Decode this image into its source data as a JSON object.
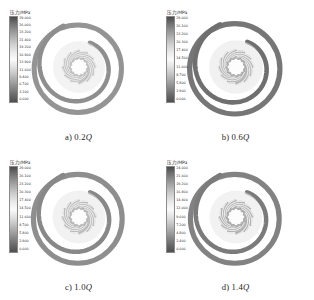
{
  "figure": {
    "type": "contour-grid",
    "columns": 2,
    "rows": 2,
    "background": "#ffffff"
  },
  "colorbar": {
    "title": "压力/MPa",
    "unit": "MPa",
    "quantity": "压力",
    "orientation": "vertical",
    "colormap": "grayscale-rainbow",
    "high_color": "#4a4a4a",
    "mid_color": "#fafafa",
    "low_color": "#4f4f4f"
  },
  "panels": [
    {
      "id": "panel-a",
      "caption_prefix": "a) 0.2",
      "caption_symbol": "Q",
      "flow_rate": "0.2Q",
      "colorbar": {
        "title": "压力/MPa",
        "ticks": [
          "29.000",
          "26.000",
          "23.200",
          "21.400",
          "19.200",
          "16.900",
          "13.900",
          "11.600",
          "9.400",
          "6.700",
          "3.200",
          "0.000"
        ]
      }
    },
    {
      "id": "panel-b",
      "caption_prefix": "b) 0.6",
      "caption_symbol": "Q",
      "flow_rate": "0.6Q",
      "colorbar": {
        "title": "压力/MPa",
        "ticks": [
          "29.000",
          "26.100",
          "23.200",
          "20.300",
          "17.400",
          "14.500",
          "11.600",
          "8.700",
          "5.800",
          "2.900",
          "0.000"
        ]
      }
    },
    {
      "id": "panel-c",
      "caption_prefix": "c) 1.0",
      "caption_symbol": "Q",
      "flow_rate": "1.0Q",
      "colorbar": {
        "title": "压力/MPa",
        "ticks": [
          "29.000",
          "26.100",
          "23.200",
          "20.300",
          "17.400",
          "14.500",
          "11.600",
          "8.700",
          "5.800",
          "2.900",
          "0.000"
        ]
      }
    },
    {
      "id": "panel-d",
      "caption_prefix": "d) 1.4",
      "caption_symbol": "Q",
      "flow_rate": "1.4Q",
      "colorbar": {
        "title": "压力/MPa",
        "ticks": [
          "24.000",
          "21.600",
          "19.200",
          "16.800",
          "14.400",
          "12.000",
          "9.600",
          "7.200",
          "4.800",
          "2.400",
          "0.000"
        ]
      }
    }
  ],
  "chart_data": {
    "type": "heatmap",
    "title": "",
    "subtitle": "",
    "xlabel": "",
    "ylabel": "",
    "legend_position": "top-left of each panel",
    "grid": false,
    "colorbar_label": "压力/MPa",
    "panels": [
      {
        "label": "a) 0.2Q",
        "flow_rate_ratio": 0.2,
        "range": [
          0.0,
          29.0
        ],
        "ticks": [
          29.0,
          26.0,
          23.2,
          21.4,
          19.2,
          16.9,
          13.9,
          11.6,
          9.4,
          6.7,
          3.2,
          0.0
        ]
      },
      {
        "label": "b) 0.6Q",
        "flow_rate_ratio": 0.6,
        "range": [
          0.0,
          29.0
        ],
        "ticks": [
          29.0,
          26.1,
          23.2,
          20.3,
          17.4,
          14.5,
          11.6,
          8.7,
          5.8,
          2.9,
          0.0
        ]
      },
      {
        "label": "c) 1.0Q",
        "flow_rate_ratio": 1.0,
        "range": [
          0.0,
          29.0
        ],
        "ticks": [
          29.0,
          26.1,
          23.2,
          20.3,
          17.4,
          14.5,
          11.6,
          8.7,
          5.8,
          2.9,
          0.0
        ]
      },
      {
        "label": "d) 1.4Q",
        "flow_rate_ratio": 1.4,
        "range": [
          0.0,
          24.0
        ],
        "ticks": [
          24.0,
          21.6,
          19.2,
          16.8,
          14.4,
          12.0,
          9.6,
          7.2,
          4.8,
          2.4,
          0.0
        ]
      }
    ],
    "geometry": {
      "blade_count": 12,
      "has_volute": true,
      "has_tongue": true
    }
  }
}
